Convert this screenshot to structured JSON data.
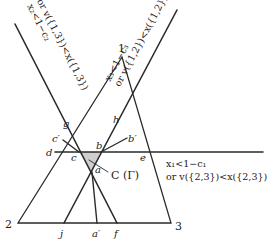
{
  "diagram": {
    "vertices": {
      "v1": {
        "label": "1",
        "x": 122,
        "y": 57
      },
      "v2": {
        "label": "2",
        "x": 18,
        "y": 223
      },
      "v3": {
        "label": "3",
        "x": 171,
        "y": 223
      }
    },
    "points": {
      "a": {
        "label": "a",
        "x": 92,
        "y": 172
      },
      "b": {
        "label": "b",
        "x": 101,
        "y": 152
      },
      "c": {
        "label": "c",
        "x": 79,
        "y": 152
      },
      "d": {
        "label": "d",
        "x": 55,
        "y": 152
      },
      "e": {
        "label": "e",
        "x": 148,
        "y": 152
      },
      "f": {
        "label": "f",
        "x": 117,
        "y": 223
      },
      "g": {
        "label": "g",
        "x": 68,
        "y": 130
      },
      "h": {
        "label": "h",
        "x": 117,
        "y": 127
      },
      "j": {
        "label": "j",
        "x": 64,
        "y": 223
      },
      "a_prime": {
        "label": "a′",
        "x": 97,
        "y": 223
      },
      "b_prime": {
        "label": "b′",
        "x": 127,
        "y": 138
      },
      "c_prime": {
        "label": "c′",
        "x": 63,
        "y": 140
      }
    },
    "region_label": "C (Γ)",
    "constraints": {
      "left": {
        "line1": "x₂<1−c₂",
        "line2": "or v({1,3})<x({1,3})"
      },
      "right": {
        "line1": "x₃<1−c₃",
        "line2": "or v({1,2})<x({1,2})"
      },
      "horizontal": {
        "line1": "x₁<1−c₁",
        "line2": "or v({2,3})<x({2,3})"
      }
    },
    "colors": {
      "line": "#2a2a2a",
      "shade": "#c8c8c8"
    }
  }
}
